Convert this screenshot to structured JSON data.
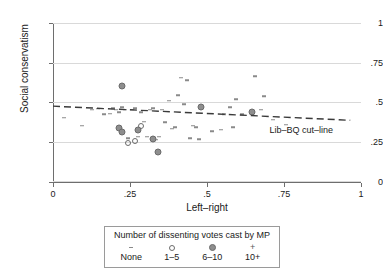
{
  "chart_data": {
    "type": "scatter",
    "title": "",
    "xlabel": "Left–right",
    "ylabel": "Social conservatism",
    "xlim": [
      0,
      1
    ],
    "ylim": [
      0,
      1
    ],
    "xticks": [
      "0",
      ".25",
      ".5",
      ".75",
      "1"
    ],
    "xtick_values": [
      0,
      0.25,
      0.5,
      0.75,
      1
    ],
    "yticks": [
      "0",
      ".25",
      ".5",
      ".75",
      "1"
    ],
    "ytick_values": [
      0,
      0.25,
      0.5,
      0.75,
      1
    ],
    "grid": "horizontal",
    "legend_position": "below-plot",
    "annotations": [
      {
        "text": "Lib–BQ cut–line",
        "x": 0.82,
        "y": 0.325
      }
    ],
    "fit_line": {
      "name": "Lib–BQ cut–line",
      "style": "dashed",
      "x_start": 0.0,
      "y_start": 0.477,
      "x_end": 0.965,
      "y_end": 0.388
    },
    "series": [
      {
        "name": "None",
        "marker": "dash",
        "points": [
          [
            0.035,
            0.405
          ],
          [
            0.095,
            0.355
          ],
          [
            0.125,
            0.455
          ],
          [
            0.145,
            0.46
          ],
          [
            0.165,
            0.425
          ],
          [
            0.185,
            0.43
          ],
          [
            0.195,
            0.465
          ],
          [
            0.205,
            0.455
          ],
          [
            0.215,
            0.44
          ],
          [
            0.225,
            0.47
          ],
          [
            0.235,
            0.455
          ],
          [
            0.245,
            0.275
          ],
          [
            0.255,
            0.455
          ],
          [
            0.265,
            0.465
          ],
          [
            0.275,
            0.285
          ],
          [
            0.285,
            0.44
          ],
          [
            0.295,
            0.38
          ],
          [
            0.305,
            0.285
          ],
          [
            0.315,
            0.455
          ],
          [
            0.325,
            0.465
          ],
          [
            0.335,
            0.265
          ],
          [
            0.345,
            0.285
          ],
          [
            0.355,
            0.455
          ],
          [
            0.365,
            0.375
          ],
          [
            0.375,
            0.51
          ],
          [
            0.385,
            0.335
          ],
          [
            0.395,
            0.345
          ],
          [
            0.405,
            0.545
          ],
          [
            0.415,
            0.655
          ],
          [
            0.425,
            0.49
          ],
          [
            0.435,
            0.64
          ],
          [
            0.445,
            0.275
          ],
          [
            0.455,
            0.355
          ],
          [
            0.465,
            0.345
          ],
          [
            0.475,
            0.27
          ],
          [
            0.515,
            0.32
          ],
          [
            0.545,
            0.33
          ],
          [
            0.555,
            0.425
          ],
          [
            0.575,
            0.47
          ],
          [
            0.585,
            0.345
          ],
          [
            0.595,
            0.52
          ],
          [
            0.615,
            0.425
          ],
          [
            0.655,
            0.665
          ],
          [
            0.675,
            0.455
          ],
          [
            0.685,
            0.54
          ],
          [
            0.715,
            0.39
          ],
          [
            0.755,
            0.36
          ]
        ]
      },
      {
        "name": "1–5",
        "marker": "open-circle",
        "points": [
          [
            0.245,
            0.245
          ],
          [
            0.265,
            0.26
          ],
          [
            0.285,
            0.355
          ],
          [
            0.325,
            0.27
          ]
        ]
      },
      {
        "name": "6–10",
        "marker": "filled-circle",
        "points": [
          [
            0.225,
            0.605
          ],
          [
            0.215,
            0.34
          ],
          [
            0.225,
            0.315
          ],
          [
            0.275,
            0.33
          ],
          [
            0.325,
            0.27
          ],
          [
            0.34,
            0.19
          ],
          [
            0.48,
            0.47
          ],
          [
            0.645,
            0.44
          ]
        ]
      },
      {
        "name": "10+",
        "marker": "plus",
        "points": []
      }
    ]
  },
  "legend": {
    "title": "Number of dissenting votes cast by MP",
    "items": [
      {
        "symbol": "dash-marker",
        "label": "None"
      },
      {
        "symbol": "open-circle-marker",
        "label": "1–5"
      },
      {
        "symbol": "filled-circle-marker",
        "label": "6–10"
      },
      {
        "symbol": "plus-marker",
        "label": "10+"
      }
    ]
  },
  "colors": {
    "grid": "#d9d9d9",
    "axis": "#6e6e6e",
    "marker": "#8a8a8a",
    "text": "#1a1a1a"
  }
}
